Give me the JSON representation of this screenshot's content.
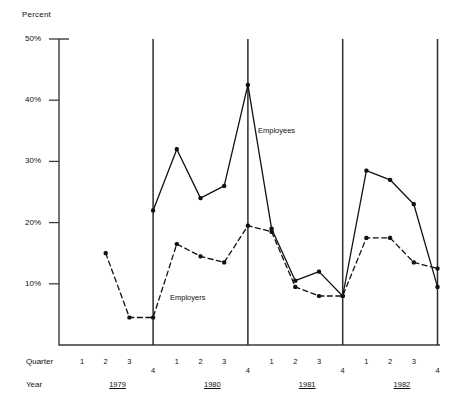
{
  "chart_data": {
    "type": "line",
    "title": "",
    "ylabel": "Percent",
    "xlabel": "Quarter",
    "ylim": [
      0,
      50
    ],
    "grid": false,
    "legend_position": "inline-annotation",
    "y_ticks": [
      "10%",
      "20%",
      "30%",
      "40%",
      "50%"
    ],
    "y_tick_values": [
      10,
      20,
      30,
      40,
      50
    ],
    "axis_rows": [
      {
        "name": "Quarter",
        "label": "Quarter"
      },
      {
        "name": "Year",
        "label": "Year"
      }
    ],
    "categories": [
      "1979 Q2",
      "1979 Q3",
      "1979 Q4",
      "1980 Q1",
      "1980 Q2",
      "1980 Q3",
      "1980 Q4",
      "1981 Q1",
      "1981 Q2",
      "1981 Q3",
      "1981 Q4",
      "1982 Q1",
      "1982 Q2",
      "1982 Q3",
      "1982 Q4"
    ],
    "quarter_ticks": [
      "1",
      "2",
      "3",
      "4",
      "1",
      "2",
      "3",
      "4",
      "1",
      "2",
      "3",
      "4",
      "1",
      "2",
      "3",
      "4"
    ],
    "year_labels": [
      "1979",
      "1980",
      "1981",
      "1982"
    ],
    "series": [
      {
        "name": "Employees",
        "style": "solid",
        "color": "#111111",
        "values": [
          null,
          null,
          22.0,
          32.0,
          24.0,
          26.0,
          42.5,
          19.0,
          10.5,
          12.0,
          8.0,
          28.5,
          27.0,
          23.0,
          9.5
        ]
      },
      {
        "name": "Employers",
        "style": "dashed",
        "color": "#111111",
        "values": [
          15.0,
          4.5,
          4.5,
          16.5,
          14.5,
          13.5,
          19.5,
          18.5,
          9.5,
          8.0,
          8.0,
          17.5,
          17.5,
          13.5,
          12.5
        ]
      }
    ],
    "annotations": [
      {
        "name": "employees-label",
        "text": "Employees"
      },
      {
        "name": "employers-label",
        "text": "Employers"
      }
    ]
  }
}
